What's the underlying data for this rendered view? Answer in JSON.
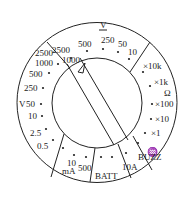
{
  "dial": {
    "dcv_unit": "V",
    "dcv_sub": "⎓",
    "acv_unit": "V",
    "acv_sub": "~",
    "ohm_unit": "Ω",
    "ma_unit": "mA",
    "ma_sub": "⎓",
    "buzz_label": "BUZZ",
    "batt_label": "BATT",
    "amp10_label": "10A",
    "acv_ranges": [
      "2500",
      "1000",
      "500",
      "250",
      "50",
      "10"
    ],
    "dcv_ranges": [
      "2500",
      "1000",
      "500",
      "250",
      "50",
      "10",
      "2.5",
      "0.5"
    ],
    "ohm_ranges": [
      "×10k",
      "×1k",
      "×100",
      "×10",
      "×1"
    ],
    "ma_ranges": [
      "10",
      "500"
    ],
    "pointer_marker": "△"
  }
}
